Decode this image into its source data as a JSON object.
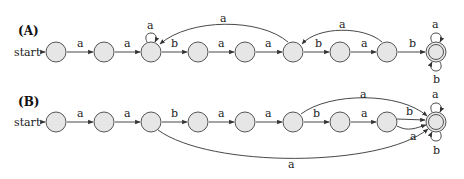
{
  "diagram": {
    "panels": [
      {
        "id": "A",
        "label": "(A)",
        "start_label": "start",
        "states": [
          {
            "id": "q0",
            "x": 56,
            "y": 52,
            "accepting": false
          },
          {
            "id": "q1",
            "x": 104,
            "y": 52,
            "accepting": false
          },
          {
            "id": "q2",
            "x": 151,
            "y": 52,
            "accepting": false
          },
          {
            "id": "q3",
            "x": 198,
            "y": 52,
            "accepting": false
          },
          {
            "id": "q4",
            "x": 245,
            "y": 52,
            "accepting": false
          },
          {
            "id": "q5",
            "x": 293,
            "y": 52,
            "accepting": false
          },
          {
            "id": "q6",
            "x": 340,
            "y": 52,
            "accepting": false
          },
          {
            "id": "q7",
            "x": 387,
            "y": 52,
            "accepting": false
          },
          {
            "id": "q8",
            "x": 436,
            "y": 52,
            "accepting": true
          }
        ],
        "transitions": [
          {
            "from": "q0",
            "to": "q1",
            "label": "a"
          },
          {
            "from": "q1",
            "to": "q2",
            "label": "a"
          },
          {
            "from": "q2",
            "to": "q2",
            "label": "a"
          },
          {
            "from": "q2",
            "to": "q3",
            "label": "b"
          },
          {
            "from": "q3",
            "to": "q4",
            "label": "a"
          },
          {
            "from": "q4",
            "to": "q5",
            "label": "a"
          },
          {
            "from": "q5",
            "to": "q2",
            "label": "a"
          },
          {
            "from": "q5",
            "to": "q6",
            "label": "b"
          },
          {
            "from": "q6",
            "to": "q7",
            "label": "a"
          },
          {
            "from": "q7",
            "to": "q5",
            "label": "a"
          },
          {
            "from": "q7",
            "to": "q8",
            "label": "b"
          },
          {
            "from": "q8",
            "to": "q8",
            "label": "a"
          },
          {
            "from": "q8",
            "to": "q8",
            "label": "b"
          }
        ]
      },
      {
        "id": "B",
        "label": "(B)",
        "start_label": "start",
        "states": [
          {
            "id": "p0",
            "x": 56,
            "y": 122,
            "accepting": false
          },
          {
            "id": "p1",
            "x": 104,
            "y": 122,
            "accepting": false
          },
          {
            "id": "p2",
            "x": 151,
            "y": 122,
            "accepting": false
          },
          {
            "id": "p3",
            "x": 198,
            "y": 122,
            "accepting": false
          },
          {
            "id": "p4",
            "x": 245,
            "y": 122,
            "accepting": false
          },
          {
            "id": "p5",
            "x": 293,
            "y": 122,
            "accepting": false
          },
          {
            "id": "p6",
            "x": 340,
            "y": 122,
            "accepting": false
          },
          {
            "id": "p7",
            "x": 387,
            "y": 122,
            "accepting": false
          },
          {
            "id": "p8",
            "x": 436,
            "y": 122,
            "accepting": true
          }
        ],
        "transitions": [
          {
            "from": "p0",
            "to": "p1",
            "label": "a"
          },
          {
            "from": "p1",
            "to": "p2",
            "label": "a"
          },
          {
            "from": "p2",
            "to": "p3",
            "label": "b"
          },
          {
            "from": "p3",
            "to": "p4",
            "label": "a"
          },
          {
            "from": "p4",
            "to": "p5",
            "label": "a"
          },
          {
            "from": "p5",
            "to": "p6",
            "label": "b"
          },
          {
            "from": "p5",
            "to": "p8",
            "label": "a"
          },
          {
            "from": "p6",
            "to": "p7",
            "label": "a"
          },
          {
            "from": "p7",
            "to": "p8",
            "label": "b"
          },
          {
            "from": "p7",
            "to": "p8",
            "label": "a"
          },
          {
            "from": "p2",
            "to": "p8",
            "label": "a"
          },
          {
            "from": "p8",
            "to": "p8",
            "label": "a"
          },
          {
            "from": "p8",
            "to": "p8",
            "label": "b"
          }
        ]
      }
    ]
  }
}
